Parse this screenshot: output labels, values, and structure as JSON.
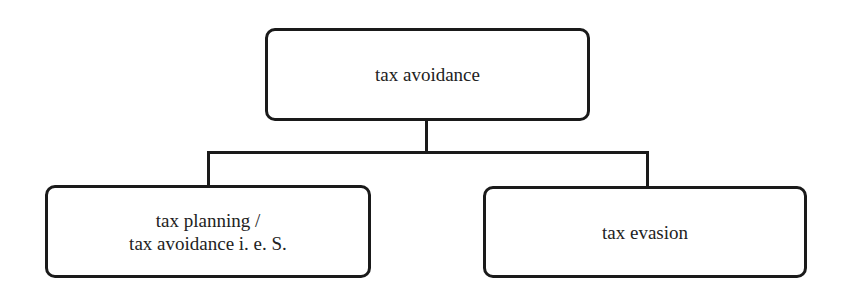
{
  "diagram": {
    "type": "hierarchy-tree",
    "root": {
      "label": "tax avoidance"
    },
    "children": [
      {
        "line1": "tax planning /",
        "line2": "tax avoidance i. e. S."
      },
      {
        "label": "tax evasion"
      }
    ],
    "colors": {
      "stroke": "#1a1a1a",
      "text": "#222222",
      "background": "#ffffff"
    }
  }
}
